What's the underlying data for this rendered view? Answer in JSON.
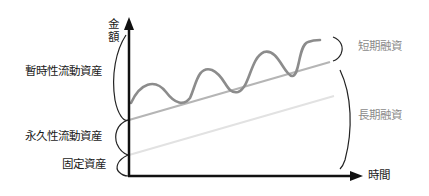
{
  "diagram": {
    "y_axis_label_lines": [
      "金",
      "額"
    ],
    "x_axis_label": "時間",
    "left_labels": {
      "temporary_current_assets": "暫時性流動資産",
      "permanent_current_assets": "永久性流動資産",
      "fixed_assets": "固定資産"
    },
    "right_labels": {
      "short_term_financing": "短期融資",
      "long_term_financing": "長期融資"
    },
    "colors": {
      "axis": "#111111",
      "wave": "#8c8c8c",
      "upper_trend": "#b3b3b3",
      "lower_trend": "#e0e0e0",
      "brace": "#222222",
      "label_gray": "#8a8a8a"
    }
  }
}
